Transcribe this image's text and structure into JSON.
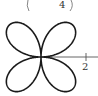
{
  "diagram": {
    "type": "polar-rose",
    "equation_hint": "r = 2 sin(2θ)",
    "petals": 4,
    "max_radius": 2,
    "axis_tick_label": "2",
    "top_partial_label": "4",
    "line_color": "#1a1a1a",
    "axis_color": "#555555"
  }
}
